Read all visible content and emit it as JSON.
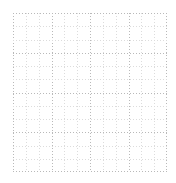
{
  "canvas": {
    "width_px": 176,
    "height_px": 183,
    "background_color": "#ffffff"
  },
  "grid": {
    "name": "dotted-grid",
    "origin_x_px": 13,
    "origin_y_px": 13,
    "width_px": 154,
    "height_px": 159,
    "columns": 12,
    "rows": 12,
    "cell_width_px": 12.83,
    "cell_height_px": 13.25,
    "line_style": "dotted",
    "line_color_major": "#b9b9b9",
    "line_color_minor": "#dcdcdc",
    "line_thickness_px": 1,
    "dot_period_px": 3,
    "vertical_line_count": 13,
    "horizontal_line_count": 13,
    "vertical_positions_px": [
      0,
      12.83,
      25.67,
      38.5,
      51.33,
      64.17,
      77,
      89.83,
      102.67,
      115.5,
      128.33,
      141.17,
      154
    ],
    "horizontal_positions_px": [
      0,
      13.25,
      26.5,
      39.75,
      53,
      66.25,
      79.5,
      92.75,
      106,
      119.25,
      132.5,
      145.75,
      159
    ]
  }
}
